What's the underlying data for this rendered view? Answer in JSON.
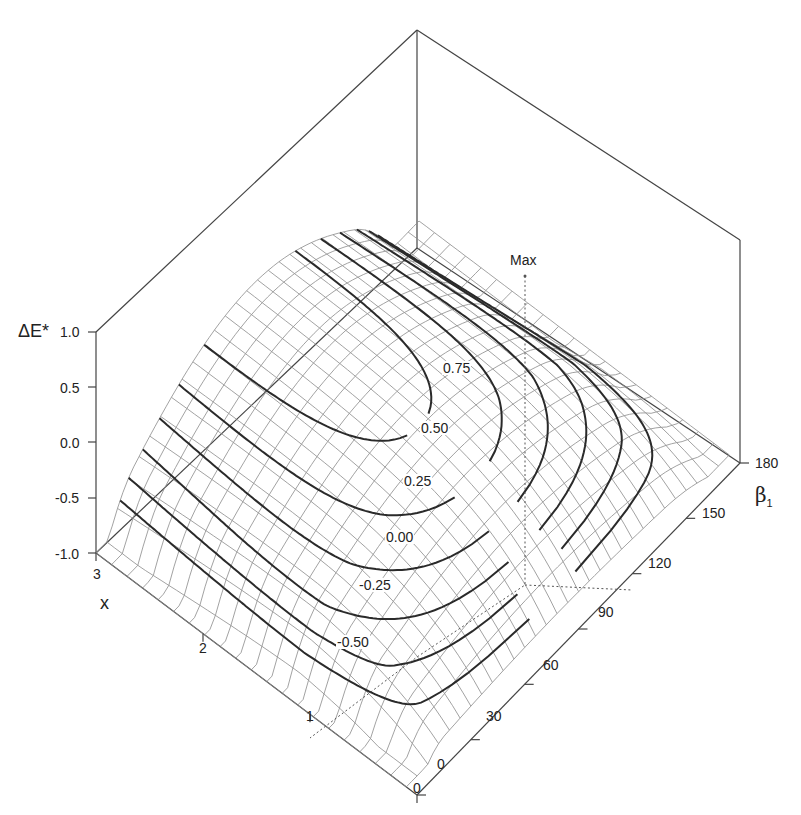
{
  "chart_data": {
    "type": "surface3d",
    "title": "",
    "axes": {
      "z": {
        "label": "ΔE*",
        "ticks": [
          "1.0",
          "0.5",
          "0.0",
          "-0.5",
          "-1.0"
        ],
        "range": [
          -1.0,
          1.0
        ]
      },
      "x": {
        "label": "x",
        "ticks": [
          "0",
          "1",
          "2",
          "3"
        ],
        "range": [
          0,
          3
        ]
      },
      "beta": {
        "label": "β",
        "label_sub": "1",
        "ticks": [
          "0",
          "30",
          "60",
          "90",
          "120",
          "150",
          "180"
        ],
        "range": [
          0,
          180
        ]
      }
    },
    "contour_levels": [
      {
        "value": -0.5,
        "label": "-0.50"
      },
      {
        "value": -0.25,
        "label": "-0.25"
      },
      {
        "value": 0.0,
        "label": "0.00"
      },
      {
        "value": 0.25,
        "label": "0.25"
      },
      {
        "value": 0.5,
        "label": "0.50"
      },
      {
        "value": 0.75,
        "label": "0.75"
      }
    ],
    "annotations": [
      {
        "text": "Max",
        "x": 1.0,
        "beta": 120,
        "note": "dotted drop line from maximum to x=1 and β1=120 on floor"
      }
    ],
    "grid": true,
    "mesh_color": "#8a8a8a",
    "contour_color": "#2a2a2a",
    "axis_color": "#444444"
  },
  "labels": {
    "z_title": "ΔE*",
    "x_title": "x",
    "beta_title": "β",
    "beta_sub": "1",
    "max": "Max",
    "z_ticks": [
      "1.0",
      "0.5",
      "0.0",
      "-0.5",
      "-1.0"
    ],
    "x_ticks": [
      "3",
      "2",
      "1",
      "0"
    ],
    "beta_ticks": [
      "0",
      "30",
      "60",
      "90",
      "120",
      "150",
      "180"
    ],
    "contours": [
      "0.75",
      "0.50",
      "0.25",
      "0.00",
      "-0.25",
      "-0.50"
    ]
  }
}
